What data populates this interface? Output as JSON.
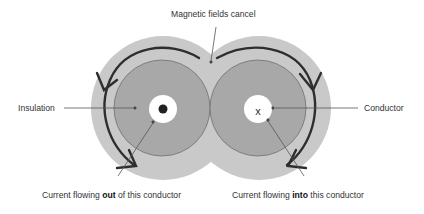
{
  "diagram": {
    "title_label": "Magnetic fields cancel",
    "labels": {
      "insulation": "Insulation",
      "conductor": "Conductor",
      "left_caption_pre": "Current flowing ",
      "left_caption_bold": "out",
      "left_caption_post": " of this conductor",
      "right_caption_pre": "Current flowing ",
      "right_caption_bold": "into",
      "right_caption_post": " this conductor",
      "into_symbol": "x"
    },
    "colors": {
      "field_region": "#c8c8c8",
      "insulation": "#a9a9a9",
      "conductor": "#ffffff",
      "arrow": "#333333",
      "leader": "#555555"
    },
    "conductors": [
      {
        "id": "left",
        "direction": "out",
        "symbol": "dot"
      },
      {
        "id": "right",
        "direction": "into",
        "symbol": "cross"
      }
    ]
  }
}
